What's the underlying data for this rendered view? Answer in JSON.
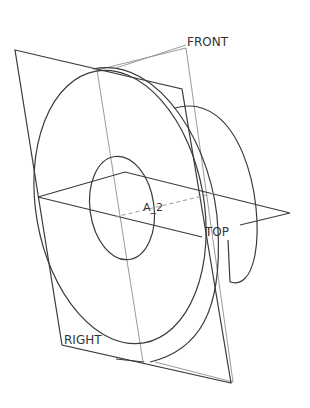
{
  "diagram": {
    "type": "cad-3d-view",
    "colors": {
      "background": "#ffffff",
      "edge": "#3a3a3a",
      "datum": "#9a9a9a",
      "label": "#333333"
    },
    "labels": {
      "front": "FRONT",
      "top": "TOP",
      "right": "RIGHT",
      "axis": "A_2"
    }
  }
}
